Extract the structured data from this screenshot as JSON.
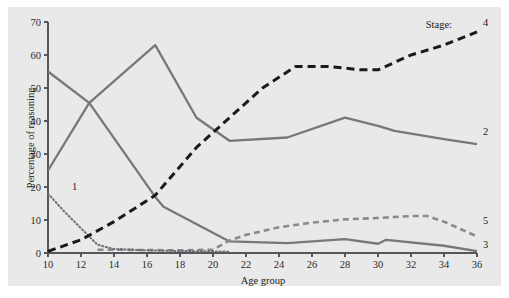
{
  "figure": {
    "background_color": "#ffffff",
    "panel_color": "#e9e9e9"
  },
  "legend": {
    "title": "Stage:",
    "position": "inline-right-of-curves",
    "entries": [
      {
        "label": "1",
        "style": "fine-dotted",
        "color": "#6d6d72"
      },
      {
        "label": "2",
        "style": "solid",
        "color": "#77777c"
      },
      {
        "label": "3",
        "style": "solid",
        "color": "#77777c"
      },
      {
        "label": "4",
        "style": "heavy-dashed",
        "color": "#1a1a1c"
      },
      {
        "label": "5",
        "style": "dashed",
        "color": "#8a8a8f"
      }
    ]
  },
  "chart_data": {
    "type": "line",
    "title": "",
    "xlabel": "Age group",
    "ylabel": "Percentage of reasoning",
    "xlim": [
      10,
      36
    ],
    "ylim": [
      0,
      70
    ],
    "xticks": [
      10,
      12,
      14,
      16,
      18,
      20,
      22,
      24,
      26,
      28,
      30,
      32,
      34,
      36
    ],
    "yticks": [
      0,
      10,
      20,
      30,
      40,
      50,
      60,
      70
    ],
    "grid": false,
    "legend_position": "right-end-of-lines",
    "series": [
      {
        "name": "1",
        "label": "1",
        "style": "fine-dotted",
        "color": "#6d6d72",
        "x": [
          10,
          11,
          12,
          13,
          14,
          16,
          18,
          20,
          21
        ],
        "values": [
          18,
          12.5,
          7.5,
          2.5,
          1.2,
          0.8,
          0.6,
          0.5,
          0.4
        ]
      },
      {
        "name": "2",
        "label": "2",
        "style": "solid",
        "color": "#77777c",
        "x": [
          10,
          12.5,
          16.5,
          19,
          21,
          24.5,
          28,
          30,
          31,
          34,
          36
        ],
        "values": [
          25,
          45.5,
          63,
          41,
          34,
          35,
          41,
          38.5,
          37,
          34.5,
          33
        ]
      },
      {
        "name": "3",
        "label": "3",
        "style": "solid",
        "color": "#77777c",
        "x": [
          10,
          12.5,
          16.5,
          17,
          21,
          24.5,
          28,
          30,
          30.5,
          34,
          36
        ],
        "values": [
          55,
          45.5,
          17,
          14,
          3.5,
          3.0,
          4.2,
          2.8,
          4.0,
          2.2,
          0.6
        ]
      },
      {
        "name": "4",
        "label": "4",
        "style": "heavy-dashed",
        "color": "#1a1a1c",
        "x": [
          10,
          12,
          14,
          16.5,
          19,
          21,
          23,
          25,
          27,
          29,
          30,
          32,
          34,
          36
        ],
        "values": [
          0.5,
          4,
          9.5,
          17.5,
          32,
          41,
          50,
          56.5,
          56.5,
          55.5,
          55.5,
          60,
          63,
          67
        ]
      },
      {
        "name": "5",
        "label": "5",
        "style": "dashed",
        "color": "#8a8a8f",
        "x": [
          13,
          14,
          16,
          18,
          20,
          21,
          22,
          24,
          26,
          28,
          30,
          32,
          33,
          34,
          36
        ],
        "values": [
          1.0,
          1.0,
          0.9,
          0.8,
          1.0,
          3.8,
          5.5,
          7.8,
          9.2,
          10.2,
          10.6,
          11.2,
          11.2,
          9.5,
          5.0
        ]
      }
    ]
  }
}
